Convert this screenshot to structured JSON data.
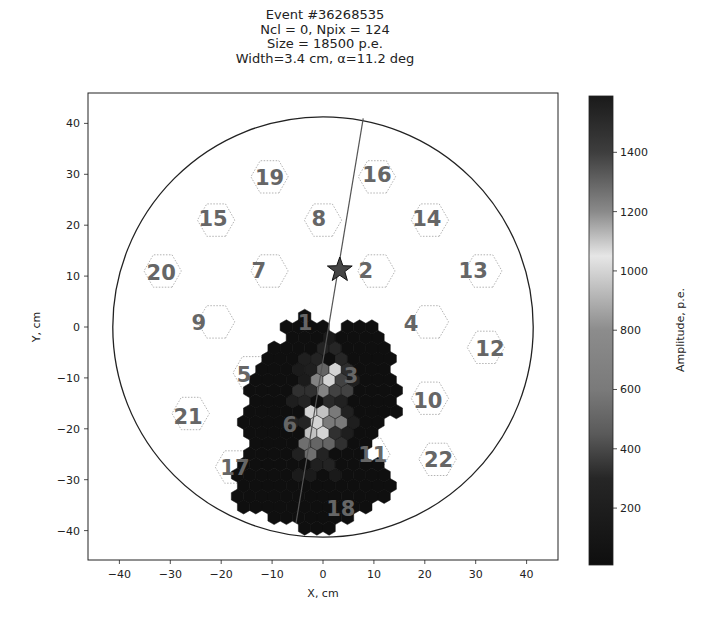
{
  "chart_data": {
    "type": "heatmap",
    "title_lines": [
      "Event #36268535",
      "Ncl = 0, Npix = 124",
      "Size = 18500 p.e.",
      "Width=3.4 cm, α=11.2 deg"
    ],
    "xlabel": "X, cm",
    "ylabel": "Y, cm",
    "xlim": [
      -46,
      46
    ],
    "ylim": [
      -46,
      46
    ],
    "xticks": [
      -40,
      -30,
      -20,
      -10,
      0,
      10,
      20,
      30,
      40
    ],
    "yticks": [
      -40,
      -30,
      -20,
      -10,
      0,
      10,
      20,
      30,
      40
    ],
    "xtick_labels": [
      "−40",
      "−30",
      "−20",
      "−10",
      "0",
      "10",
      "20",
      "30",
      "40"
    ],
    "ytick_labels": [
      "−40",
      "−30",
      "−20",
      "−10",
      "0",
      "10",
      "20",
      "30",
      "40"
    ],
    "camera_radius_cm": 41.3,
    "camera_center_cm": [
      0,
      0
    ],
    "hillas_axis": {
      "from": [
        7.9,
        41.0
      ],
      "to": [
        -5.3,
        -38.5
      ]
    },
    "source_star_cm": [
      3.3,
      11.2
    ],
    "colorbar": {
      "label": "Amplitude, p.e.",
      "range": [
        8,
        1590
      ],
      "ticks": [
        200,
        400,
        600,
        800,
        1000,
        1200,
        1400
      ],
      "tick_labels": [
        "200",
        "400",
        "600",
        "800",
        "1000",
        "1200",
        "1400"
      ],
      "stops": [
        {
          "value": 8,
          "color": "#0e0e0e"
        },
        {
          "value": 300,
          "color": "#262626"
        },
        {
          "value": 450,
          "color": "#5a5a5a"
        },
        {
          "value": 600,
          "color": "#7a7a7a"
        },
        {
          "value": 800,
          "color": "#8c8c8c"
        },
        {
          "value": 1050,
          "color": "#e6e6e6"
        },
        {
          "value": 1200,
          "color": "#8a8a8a"
        },
        {
          "value": 1400,
          "color": "#3e3e3e"
        },
        {
          "value": 1590,
          "color": "#1a1a1a"
        }
      ]
    },
    "pixel_grid": {
      "pitch_cm": 2.4,
      "region_polygon_cm": [
        [
          -6.9,
          1.0
        ],
        [
          -4.5,
          2.8
        ],
        [
          -1.4,
          1.8
        ],
        [
          1.4,
          -0.6
        ],
        [
          4.3,
          1.0
        ],
        [
          9.6,
          1.0
        ],
        [
          12.2,
          -1.6
        ],
        [
          13.6,
          -6.5
        ],
        [
          14.7,
          -13.4
        ],
        [
          15.1,
          -16.7
        ],
        [
          12.2,
          -19.3
        ],
        [
          9.6,
          -23.2
        ],
        [
          7.3,
          -25.1
        ],
        [
          13.2,
          -28.1
        ],
        [
          13.8,
          -32.0
        ],
        [
          10.2,
          -35.0
        ],
        [
          5.3,
          -38.9
        ],
        [
          -0.6,
          -40.9
        ],
        [
          -4.5,
          -39.5
        ],
        [
          -10.0,
          -37.9
        ],
        [
          -16.3,
          -36.0
        ],
        [
          -18.3,
          -33.0
        ],
        [
          -17.3,
          -27.1
        ],
        [
          -15.3,
          -22.2
        ],
        [
          -16.3,
          -17.3
        ],
        [
          -15.3,
          -13.4
        ],
        [
          -13.4,
          -8.4
        ],
        [
          -12.0,
          -4.5
        ],
        [
          -8.4,
          -2.6
        ]
      ],
      "default_amplitude": 20,
      "bright_pixels": [
        [
          1.7,
          -8.3,
          1000
        ],
        [
          1.2,
          -11.1,
          1080
        ],
        [
          -1.2,
          -11.7,
          700
        ],
        [
          -1.0,
          -9.0,
          500
        ],
        [
          0.4,
          -16.8,
          950
        ],
        [
          -1.9,
          -17.9,
          1000
        ],
        [
          0.2,
          -19.9,
          1000
        ],
        [
          -2.7,
          -20.6,
          950
        ],
        [
          2.4,
          -18.0,
          600
        ],
        [
          -2.6,
          -23.5,
          550
        ],
        [
          -0.3,
          -22.9,
          500
        ],
        [
          3.6,
          -12.0,
          380
        ],
        [
          -3.6,
          -12.8,
          330
        ],
        [
          2.8,
          -5.0,
          300
        ],
        [
          -0.6,
          -5.2,
          260
        ],
        [
          4.0,
          -8.8,
          320
        ],
        [
          3.0,
          -21.8,
          330
        ],
        [
          -4.9,
          -19.0,
          280
        ],
        [
          -5.0,
          -24.5,
          240
        ],
        [
          0.9,
          -26.2,
          260
        ],
        [
          -1.8,
          -27.3,
          230
        ],
        [
          -3.1,
          -15.2,
          270
        ],
        [
          -5.3,
          -14.4,
          200
        ],
        [
          1.9,
          -14.6,
          310
        ],
        [
          4.5,
          -15.5,
          240
        ],
        [
          5.5,
          -11.0,
          200
        ],
        [
          0.8,
          -3.2,
          160
        ],
        [
          -2.4,
          -7.1,
          220
        ],
        [
          -4.2,
          -9.6,
          170
        ],
        [
          5.0,
          -19.2,
          200
        ],
        [
          -3.9,
          -29.4,
          170
        ],
        [
          2.5,
          -29.8,
          150
        ]
      ]
    },
    "cluster_labels": [
      {
        "id": "19",
        "x": -10.5,
        "y": 29.5
      },
      {
        "id": "16",
        "x": 10.6,
        "y": 30.0
      },
      {
        "id": "15",
        "x": -21.6,
        "y": 21.4
      },
      {
        "id": "8",
        "x": -0.8,
        "y": 21.4
      },
      {
        "id": "14",
        "x": 20.4,
        "y": 21.4
      },
      {
        "id": "20",
        "x": -31.8,
        "y": 10.8
      },
      {
        "id": "7",
        "x": -12.6,
        "y": 11.2
      },
      {
        "id": "2",
        "x": 8.4,
        "y": 11.2
      },
      {
        "id": "13",
        "x": 29.5,
        "y": 11.2
      },
      {
        "id": "9",
        "x": -24.4,
        "y": 1.0
      },
      {
        "id": "1",
        "x": -3.5,
        "y": 1.0
      },
      {
        "id": "4",
        "x": 17.3,
        "y": 0.8
      },
      {
        "id": "12",
        "x": 32.8,
        "y": -4.1
      },
      {
        "id": "5",
        "x": -15.5,
        "y": -9.2
      },
      {
        "id": "3",
        "x": 5.5,
        "y": -9.4
      },
      {
        "id": "10",
        "x": 20.6,
        "y": -14.3
      },
      {
        "id": "21",
        "x": -26.5,
        "y": -17.5
      },
      {
        "id": "6",
        "x": -6.5,
        "y": -19.0
      },
      {
        "id": "11",
        "x": 9.8,
        "y": -25.0
      },
      {
        "id": "22",
        "x": 22.7,
        "y": -26.0
      },
      {
        "id": "17",
        "x": -17.3,
        "y": -27.5
      },
      {
        "id": "18",
        "x": 3.5,
        "y": -35.5
      }
    ],
    "cluster_outlines": [
      {
        "id": "19",
        "cx": -10.5,
        "cy": 29.5
      },
      {
        "id": "16",
        "cx": 10.6,
        "cy": 29.5
      },
      {
        "id": "15",
        "cx": -21.0,
        "cy": 21.0
      },
      {
        "id": "8",
        "cx": 0.0,
        "cy": 21.0
      },
      {
        "id": "14",
        "cx": 21.0,
        "cy": 21.0
      },
      {
        "id": "20",
        "cx": -31.5,
        "cy": 11.0
      },
      {
        "id": "7",
        "cx": -10.5,
        "cy": 11.0
      },
      {
        "id": "2",
        "cx": 10.5,
        "cy": 11.0
      },
      {
        "id": "13",
        "cx": 31.5,
        "cy": 11.0
      },
      {
        "id": "9",
        "cx": -21.0,
        "cy": 1.0
      },
      {
        "id": "4",
        "cx": 21.0,
        "cy": 1.0
      },
      {
        "id": "12",
        "cx": 32.0,
        "cy": -4.0
      },
      {
        "id": "5",
        "cx": -14.0,
        "cy": -9.0
      },
      {
        "id": "10",
        "cx": 21.0,
        "cy": -14.0
      },
      {
        "id": "21",
        "cx": -26.0,
        "cy": -17.0
      },
      {
        "id": "22",
        "cx": 22.5,
        "cy": -26.0
      },
      {
        "id": "17",
        "cx": -17.5,
        "cy": -27.5
      },
      {
        "id": "11",
        "cx": 9.5,
        "cy": -25.0
      }
    ]
  }
}
